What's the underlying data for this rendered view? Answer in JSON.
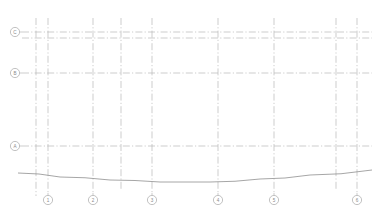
{
  "drawing": {
    "type": "architectural-elevation-grid",
    "title": "",
    "canvas": {
      "width": 384,
      "height": 222
    },
    "background_color": "#ffffff",
    "grid_line_color": "#b8b8b8",
    "grid_line_style": "dash-dot",
    "bubble_stroke_color": "#a8a8a8",
    "bubble_text_color": "#8a8a8a",
    "ground_line_color": "#8f8f8f"
  },
  "column_grid": {
    "axis": "vertical",
    "label_position": "bottom",
    "lines": [
      {
        "id": "col-a",
        "x": 36,
        "label": "",
        "bubbled": false,
        "top": 18,
        "bottom": 196
      },
      {
        "id": "col-1",
        "x": 48,
        "label": "1",
        "bubbled": true,
        "top": 18,
        "bottom": 193
      },
      {
        "id": "col-2",
        "x": 93,
        "label": "2",
        "bubbled": true,
        "top": 18,
        "bottom": 193
      },
      {
        "id": "col-b",
        "x": 121,
        "label": "",
        "bubbled": false,
        "top": 18,
        "bottom": 190
      },
      {
        "id": "col-3",
        "x": 152,
        "label": "3",
        "bubbled": true,
        "top": 18,
        "bottom": 193
      },
      {
        "id": "col-4",
        "x": 218,
        "label": "4",
        "bubbled": true,
        "top": 18,
        "bottom": 193
      },
      {
        "id": "col-5",
        "x": 274,
        "label": "5",
        "bubbled": true,
        "top": 18,
        "bottom": 193
      },
      {
        "id": "col-c",
        "x": 336,
        "label": "",
        "bubbled": false,
        "top": 18,
        "bottom": 190
      },
      {
        "id": "col-6",
        "x": 357,
        "label": "6",
        "bubbled": true,
        "top": 18,
        "bottom": 193
      }
    ]
  },
  "row_grid": {
    "axis": "horizontal",
    "label_position": "left",
    "lines": [
      {
        "id": "row-c",
        "y": 32,
        "label": "C",
        "bubbled": true,
        "left": 22,
        "right": 372
      },
      {
        "id": "row-c2",
        "y": 38,
        "label": "",
        "bubbled": false,
        "left": 22,
        "right": 372
      },
      {
        "id": "row-b",
        "y": 73,
        "label": "B",
        "bubbled": true,
        "left": 22,
        "right": 372
      },
      {
        "id": "row-a",
        "y": 146,
        "label": "A",
        "bubbled": true,
        "left": 22,
        "right": 372
      }
    ]
  },
  "ground_line": {
    "id": "ground-profile",
    "description": "gentle concave ground / grade profile curve",
    "points": [
      {
        "x": 18,
        "y": 173
      },
      {
        "x": 60,
        "y": 177
      },
      {
        "x": 110,
        "y": 180
      },
      {
        "x": 160,
        "y": 182
      },
      {
        "x": 210,
        "y": 182
      },
      {
        "x": 260,
        "y": 179
      },
      {
        "x": 310,
        "y": 175
      },
      {
        "x": 372,
        "y": 170
      }
    ]
  },
  "bubble": {
    "radius": 4.6
  }
}
